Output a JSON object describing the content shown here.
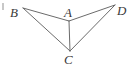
{
  "figure": {
    "background_color": "#ffffff",
    "line_color": "#6b6b6b",
    "label_color": "#3a3a3a",
    "vertices": [
      {
        "id": "B",
        "label": "B",
        "x": 23,
        "y": 8,
        "label_x": 10,
        "label_y": 6
      },
      {
        "id": "A",
        "label": "A",
        "x": 69,
        "y": 21,
        "label_x": 64,
        "label_y": 6
      },
      {
        "id": "D",
        "label": "D",
        "x": 115,
        "y": 5,
        "label_x": 117,
        "label_y": 4
      },
      {
        "id": "C",
        "label": "C",
        "x": 70,
        "y": 51,
        "label_x": 64,
        "label_y": 53
      }
    ],
    "edges": [
      {
        "id": "BA",
        "from": "B",
        "to": "A"
      },
      {
        "id": "AD",
        "from": "A",
        "to": "D"
      },
      {
        "id": "BC",
        "from": "B",
        "to": "C"
      },
      {
        "id": "CD",
        "from": "C",
        "to": "D"
      },
      {
        "id": "AC",
        "from": "A",
        "to": "C"
      }
    ],
    "artifact": {
      "x": 2,
      "y": 3,
      "width": 2,
      "height": 7
    }
  }
}
